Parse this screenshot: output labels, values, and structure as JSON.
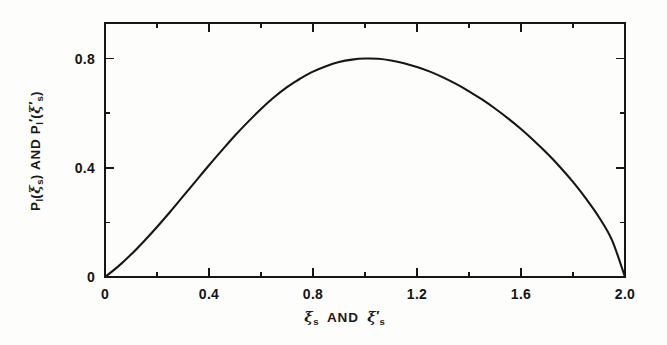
{
  "figure": {
    "background_color": "#fdfdfb",
    "ink_color": "#161616",
    "frame": {
      "left": 105,
      "right": 625,
      "top": 23,
      "bottom": 277
    }
  },
  "axes": {
    "x_label_parts": {
      "xi1": "ξ",
      "sub1": "s",
      "and": "AND",
      "xi2": "ξ",
      "prime2": "′",
      "sub2": "s"
    },
    "y_label_parts": {
      "p1": "P",
      "p1_sub": "l",
      "open1": "(",
      "xi1": "ξ",
      "xi1_sub": "s",
      "close1": ")",
      "and": "AND",
      "p2": "P",
      "p2_sub": "l",
      "p2_prime": "′",
      "open2": "(",
      "xi2": "ξ",
      "xi2_prime": "′",
      "xi2_sub": "s",
      "close2": ")"
    },
    "x_label_text": "ξs AND ξ's",
    "y_label_text": "Pl(ξs) AND Pl'(ξ's)"
  },
  "chart_data": {
    "type": "line",
    "title": "",
    "subtitle": "",
    "xlabel": "ξ_s AND ξ'_s",
    "ylabel": "P_l(ξ_s) AND P'_l(ξ'_s)",
    "xlim": [
      0,
      2.0
    ],
    "ylim": [
      0,
      0.93
    ],
    "grid": false,
    "legend": null,
    "x_ticks": [
      0,
      0.4,
      0.8,
      1.2,
      1.6,
      2.0
    ],
    "x_tick_labels": [
      "0",
      "0.4",
      "0.8",
      "1.2",
      "1.6",
      "2.0"
    ],
    "x_minor_ticks": [
      0.2,
      0.6,
      1.0,
      1.4,
      1.8
    ],
    "y_ticks": [
      0,
      0.4,
      0.8
    ],
    "y_tick_labels": [
      "0",
      "0.4",
      "0.8"
    ],
    "y_minor_ticks": [
      0.2,
      0.6
    ],
    "annotations": [],
    "series": [
      {
        "name": "P_l(ξ_s)",
        "color": "#161616",
        "line_width": 2.1,
        "peak_x": 0.73,
        "peak_y": 0.8,
        "x": [
          0.0,
          0.05,
          0.1,
          0.15,
          0.2,
          0.25,
          0.3,
          0.35,
          0.4,
          0.45,
          0.5,
          0.55,
          0.6,
          0.65,
          0.7,
          0.73,
          0.75,
          0.8,
          0.85,
          0.9,
          0.95,
          1.0,
          1.05,
          1.1,
          1.15,
          1.2,
          1.25,
          1.3,
          1.35,
          1.4,
          1.45,
          1.5,
          1.55,
          1.6,
          1.65,
          1.7,
          1.75,
          1.8,
          1.85,
          1.9,
          1.95,
          2.0
        ],
        "y": [
          0.0,
          0.038,
          0.082,
          0.131,
          0.183,
          0.238,
          0.295,
          0.352,
          0.409,
          0.464,
          0.518,
          0.568,
          0.615,
          0.658,
          0.695,
          0.714,
          0.726,
          0.752,
          0.772,
          0.787,
          0.796,
          0.8,
          0.799,
          0.793,
          0.783,
          0.769,
          0.752,
          0.731,
          0.707,
          0.68,
          0.65,
          0.617,
          0.581,
          0.542,
          0.499,
          0.453,
          0.403,
          0.348,
          0.287,
          0.219,
          0.135,
          0.0
        ]
      }
    ]
  }
}
